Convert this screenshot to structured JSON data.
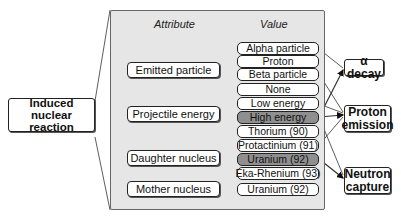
{
  "root": {
    "label": "Induced nuclear reaction"
  },
  "panel": {
    "attribute_header": "Attribute",
    "value_header": "Value"
  },
  "attributes": [
    {
      "label": "Emitted particle"
    },
    {
      "label": "Projectile energy"
    },
    {
      "label": "Daughter nucleus"
    },
    {
      "label": "Mother nucleus"
    }
  ],
  "values": [
    {
      "label": "Alpha particle",
      "group": "Emitted particle",
      "highlighted": false
    },
    {
      "label": "Proton",
      "group": "Emitted particle",
      "highlighted": false
    },
    {
      "label": "Beta particle",
      "group": "Emitted particle",
      "highlighted": false
    },
    {
      "label": "None",
      "group": "Emitted particle",
      "highlighted": false
    },
    {
      "label": "Low energy",
      "group": "Projectile energy",
      "highlighted": false
    },
    {
      "label": "High energy",
      "group": "Projectile energy",
      "highlighted": true
    },
    {
      "label": "Thorium (90)",
      "group": "Daughter nucleus",
      "highlighted": false
    },
    {
      "label": "Protactinium (91)",
      "group": "Daughter nucleus",
      "highlighted": false
    },
    {
      "label": "Uranium (92)",
      "group": "Daughter nucleus",
      "highlighted": true
    },
    {
      "label": "Eka-Rhenium (93)",
      "group": "Daughter nucleus",
      "highlighted": false
    },
    {
      "label": "Uranium (92)",
      "group": "Mother nucleus",
      "highlighted": false
    }
  ],
  "outcomes": [
    {
      "label": "α decay"
    },
    {
      "label": "Proton emission"
    },
    {
      "label": "Neutron capture"
    }
  ],
  "colors": {
    "panel_bg": "#e6e6e6",
    "highlight": "#8f8f8f",
    "line": "#222222"
  }
}
